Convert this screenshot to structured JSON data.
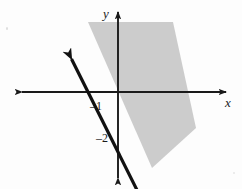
{
  "figure": {
    "background_color": "#fdfdfd",
    "axis_color": "#1a1a1a",
    "line_color": "#111111",
    "shade_color": "#c9c9c9",
    "width": 242,
    "height": 189
  },
  "axes": {
    "x_label": "x",
    "y_label": "y",
    "origin_px": {
      "x": 118,
      "y": 92
    },
    "unit_px": 30,
    "x_axis": {
      "start_px": 20,
      "end_px": 228,
      "y_px": 92,
      "arrows": "both"
    },
    "y_axis": {
      "start_px": 10,
      "end_px": 180,
      "x_px": 118,
      "arrows": "both"
    }
  },
  "tick_labels": [
    {
      "text": "–1",
      "value": -1,
      "axis": "x",
      "x_px": 96,
      "y_px": 108
    },
    {
      "text": "–2",
      "value": -2,
      "axis": "y",
      "x_px": 102,
      "y_px": 140
    }
  ],
  "chart_data": {
    "type": "line",
    "title": "",
    "xlabel": "x",
    "ylabel": "y",
    "xlim": [
      -3.3,
      3.7
    ],
    "ylim": [
      -2.9,
      2.8
    ],
    "grid": false,
    "legend": "none",
    "series": [
      {
        "name": "boundary line",
        "equation": "y = -2x - 2",
        "slope": -2,
        "y_intercept": -2,
        "x_intercept": -1,
        "style": "solid",
        "arrows": "both",
        "x": [
          -1.55,
          1.15
        ],
        "y": [
          1.1,
          -4.3
        ]
      }
    ],
    "shaded_region": {
      "name": "shaded band",
      "description": "light gray band to the right of and parallel to the line",
      "fill": "#c9c9c9",
      "polygon_px": [
        [
          88,
          22
        ],
        [
          173,
          22
        ],
        [
          196,
          128
        ],
        [
          152,
          168
        ]
      ]
    },
    "annotations": [
      {
        "text": "–1",
        "x": -1,
        "y": 0
      },
      {
        "text": "–2",
        "x": 0,
        "y": -2
      }
    ]
  }
}
